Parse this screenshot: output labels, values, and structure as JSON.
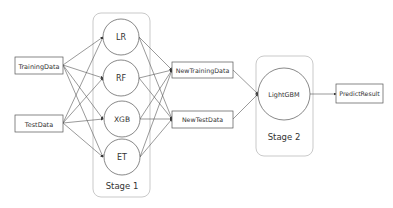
{
  "inputs": [
    {
      "label": "TrainingData"
    },
    {
      "label": "TestData"
    }
  ],
  "stage1": {
    "label": "Stage 1",
    "models": [
      {
        "label": "LR"
      },
      {
        "label": "RF"
      },
      {
        "label": "XGB"
      },
      {
        "label": "ET"
      }
    ]
  },
  "intermediate": [
    {
      "label": "NewTrainingData"
    },
    {
      "label": "NewTestData"
    }
  ],
  "stage2": {
    "label": "Stage 2",
    "model": {
      "label": "LightGBM"
    }
  },
  "output": {
    "label": "PredictResult"
  },
  "colors": {
    "stroke": "#555555",
    "group_border": "#bbbbbb",
    "text": "#333333",
    "background": "#ffffff"
  }
}
